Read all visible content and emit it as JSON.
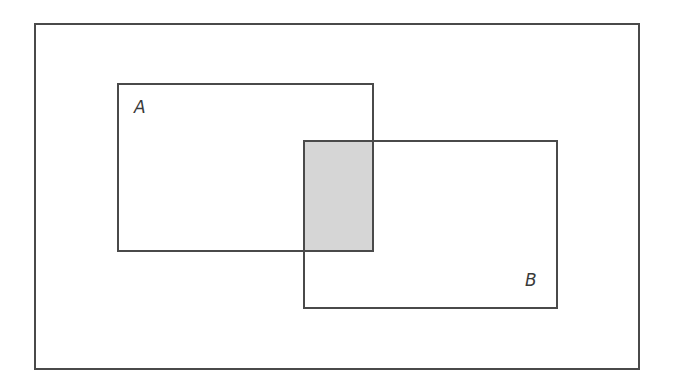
{
  "diagram": {
    "type": "venn-rectangles",
    "universe": {
      "label": "",
      "x": 34,
      "y": 23,
      "w": 606,
      "h": 347
    },
    "set_a": {
      "label": "A",
      "x": 117,
      "y": 83,
      "w": 257,
      "h": 169
    },
    "set_b": {
      "label": "B",
      "x": 303,
      "y": 140,
      "w": 255,
      "h": 169
    },
    "intersection": {
      "description": "A ∩ B shaded",
      "x": 304,
      "y": 141,
      "w": 69,
      "h": 110,
      "color": "#d6d6d6"
    },
    "colors": {
      "stroke": "#4a4a4a",
      "fill": "#ffffff",
      "shade": "#d6d6d6"
    }
  }
}
